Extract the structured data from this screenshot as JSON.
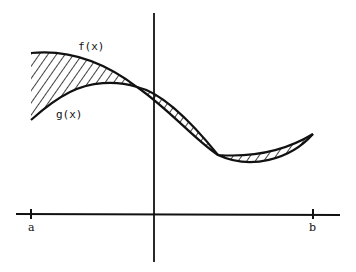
{
  "diagram": {
    "type": "area-between-curves",
    "labels": {
      "f": "f(x)",
      "g": "g(x)",
      "a": "a",
      "b": "b"
    },
    "colors": {
      "ink": "#111111",
      "background": "#ffffff"
    }
  }
}
